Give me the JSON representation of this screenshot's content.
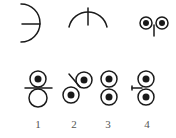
{
  "diagram": {
    "top_row": [
      {
        "name": "arc-left-with-horizontal-tick",
        "description": "right-facing semicircular arc with horizontal tick to center"
      },
      {
        "name": "arc-top-with-vertical-tick",
        "description": "upper arc with vertical tick to center"
      },
      {
        "name": "two-eyes-with-stem",
        "description": "two ringed dots side by side with short stem"
      }
    ],
    "bottom_row": [
      {
        "id": 1,
        "label": "1",
        "description": "dotted circle above empty circle, horizontal line between"
      },
      {
        "id": 2,
        "label": "2",
        "description": "two dotted circles diagonal, slanted line"
      },
      {
        "id": 3,
        "label": "3",
        "description": "two dotted circles stacked vertically"
      },
      {
        "id": 4,
        "label": "4",
        "description": "two dotted circles stacked, short line from left"
      }
    ],
    "colors": {
      "stroke": "#1a1a1a",
      "label": "#555555",
      "background": "#ffffff"
    }
  }
}
